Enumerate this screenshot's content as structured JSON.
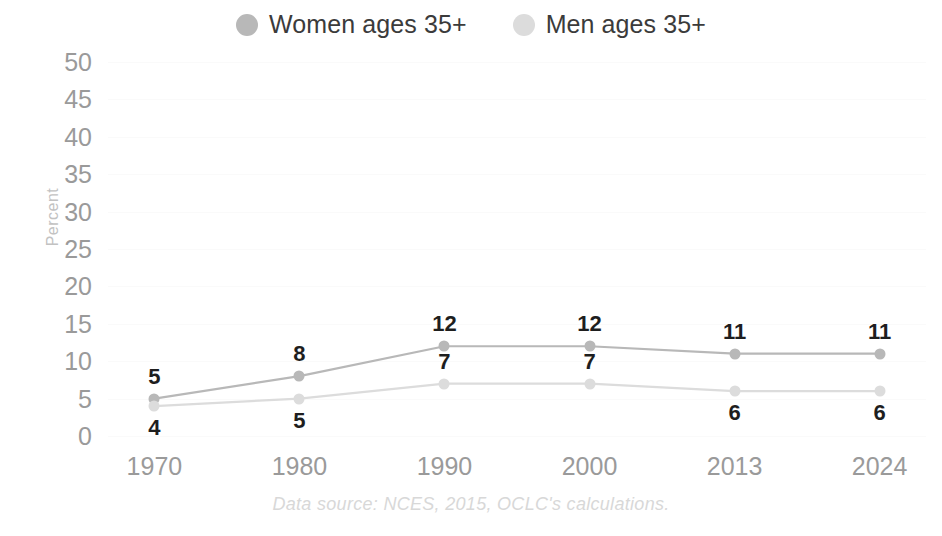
{
  "chart_data": {
    "type": "line",
    "title": "",
    "xlabel": "",
    "ylabel": "Percent",
    "categories": [
      "1970",
      "1980",
      "1990",
      "2000",
      "2013",
      "2024"
    ],
    "ylim": [
      0,
      50
    ],
    "ytick_step": 5,
    "yticks": [
      "50",
      "45",
      "40",
      "35",
      "30",
      "25",
      "20",
      "15",
      "10",
      "5",
      "0"
    ],
    "grid": true,
    "legend_position": "top-center",
    "series": [
      {
        "name": "Women ages 35+",
        "color": "#b8b8b8",
        "values": [
          5,
          8,
          12,
          12,
          11,
          11
        ],
        "label_position": [
          "above",
          "above",
          "above",
          "above",
          "above",
          "above"
        ]
      },
      {
        "name": "Men ages 35+",
        "color": "#dcdcdc",
        "values": [
          4,
          5,
          7,
          7,
          6,
          6
        ],
        "label_position": [
          "below",
          "below",
          "above",
          "above",
          "below",
          "below"
        ]
      }
    ],
    "annotations": {
      "source": "Data source: NCES, 2015, OCLC's calculations."
    }
  },
  "legend": {
    "items": [
      {
        "label": "Women ages 35+",
        "swatch": "legend-dot-women",
        "color": "#b8b8b8"
      },
      {
        "label": "Men ages 35+",
        "swatch": "legend-dot-men",
        "color": "#dcdcdc"
      }
    ]
  },
  "axes": {
    "y_title": "Percent"
  },
  "footer": {
    "source": "Data source: NCES, 2015, OCLC's calculations."
  }
}
